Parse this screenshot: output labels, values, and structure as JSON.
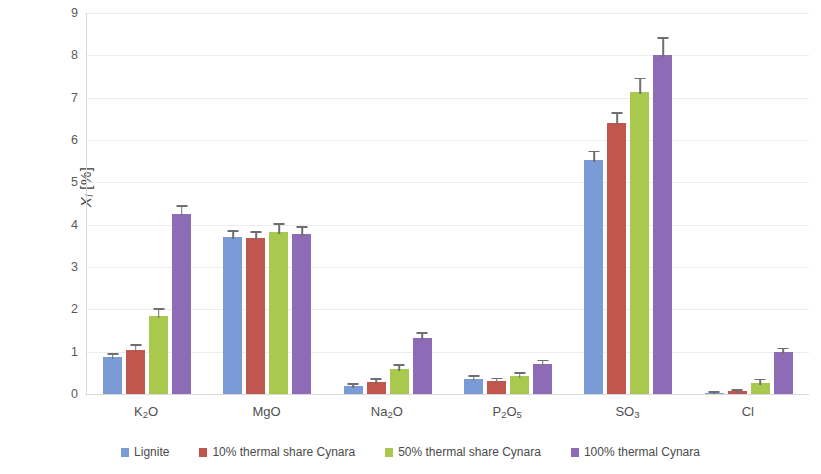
{
  "chart_data": {
    "type": "bar",
    "title": "",
    "subtitle": "",
    "xlabel": "",
    "ylabel": "Xᵢ [%]",
    "ylabel_parts": {
      "symbol": "X",
      "subscript": "i",
      "unit": "[%]"
    },
    "ylim": [
      0,
      9
    ],
    "ytick_labels": [
      "0",
      "1",
      "2",
      "3",
      "4",
      "5",
      "6",
      "7",
      "8",
      "9"
    ],
    "ytick_values": [
      0,
      1,
      2,
      3,
      4,
      5,
      6,
      7,
      8,
      9
    ],
    "grid": true,
    "grid_axis": "y",
    "legend_position": "bottom",
    "categories": [
      "K₂O",
      "MgO",
      "Na₂O",
      "P₂O₅",
      "SO₃",
      "Cl"
    ],
    "category_parts": [
      {
        "pre": "K",
        "sub": "2",
        "post": "O"
      },
      {
        "pre": "Mg",
        "sub": "",
        "post": "O"
      },
      {
        "pre": "Na",
        "sub": "2",
        "post": "O"
      },
      {
        "pre": "P",
        "sub": "2",
        "post": "O",
        "sub2": "5"
      },
      {
        "pre": "SO",
        "sub": "3",
        "post": ""
      },
      {
        "pre": "Cl",
        "sub": "",
        "post": ""
      }
    ],
    "series": [
      {
        "name": "Lignite",
        "color": "#7B9BD6",
        "values": [
          0.87,
          3.7,
          0.18,
          0.35,
          5.53,
          0.02
        ],
        "errors": [
          0.06,
          0.13,
          0.04,
          0.05,
          0.18,
          0.01
        ]
      },
      {
        "name": "10% thermal share Cynara",
        "color": "#C0564E",
        "values": [
          1.05,
          3.68,
          0.28,
          0.3,
          6.4,
          0.06
        ],
        "errors": [
          0.09,
          0.13,
          0.05,
          0.05,
          0.22,
          0.02
        ]
      },
      {
        "name": "50% thermal share Cynara",
        "color": "#A9C94E",
        "values": [
          1.85,
          3.82,
          0.6,
          0.42,
          7.13,
          0.27
        ],
        "errors": [
          0.14,
          0.18,
          0.06,
          0.06,
          0.3,
          0.05
        ]
      },
      {
        "name": "100% thermal Cynara",
        "color": "#8E6BB6",
        "values": [
          4.25,
          3.78,
          1.32,
          0.7,
          8.02,
          1.0
        ],
        "errors": [
          0.17,
          0.14,
          0.1,
          0.07,
          0.37,
          0.06
        ]
      }
    ]
  },
  "legend": {
    "items": [
      {
        "label": "Lignite",
        "color": "#7B9BD6"
      },
      {
        "label": "10% thermal share Cynara",
        "color": "#C0564E"
      },
      {
        "label": "50% thermal share Cynara",
        "color": "#A9C94E"
      },
      {
        "label": "100% thermal Cynara",
        "color": "#8E6BB6"
      }
    ]
  }
}
